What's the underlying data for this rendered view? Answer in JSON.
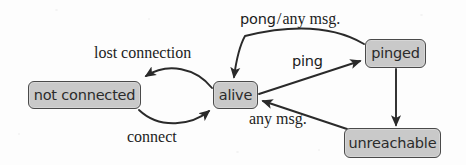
{
  "diagram": {
    "width": 466,
    "height": 165,
    "background_color": "#fdfdfd",
    "node_fill_color": "#c9c9c9",
    "node_border_color": "#4a4a4a",
    "edge_color": "#2a2a2a"
  },
  "states": [
    {
      "id": "not_connected",
      "label": "not connected"
    },
    {
      "id": "alive",
      "label": "alive"
    },
    {
      "id": "pinged",
      "label": "pinged"
    },
    {
      "id": "unreachable",
      "label": "unreachable"
    }
  ],
  "transitions": [
    {
      "id": "alive_to_not_connected",
      "from": "alive",
      "to": "not connected",
      "label": "lost connection"
    },
    {
      "id": "not_connected_to_alive",
      "from": "not connected",
      "to": "alive",
      "label": "connect"
    },
    {
      "id": "alive_to_pinged",
      "from": "alive",
      "to": "pinged",
      "label": "ping"
    },
    {
      "id": "pinged_to_alive",
      "from": "pinged",
      "to": "alive",
      "label": "pong/any msg.",
      "label_parts": {
        "event": "pong",
        "separator": "/",
        "alt": "any msg."
      }
    },
    {
      "id": "pinged_to_unreachable",
      "from": "pinged",
      "to": "unreachable",
      "label": ""
    },
    {
      "id": "unreachable_to_alive",
      "from": "unreachable",
      "to": "alive",
      "label": "any msg."
    }
  ],
  "labels": {
    "lost_connection": "lost connection",
    "connect": "connect",
    "ping": "ping",
    "any_msg": "any msg.",
    "pong": "pong",
    "slash": "/",
    "pong_alt": "any msg."
  }
}
